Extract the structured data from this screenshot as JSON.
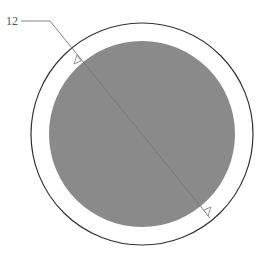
{
  "diagram": {
    "label": "12",
    "colors": {
      "outer_stroke": "#333333",
      "inner_fill": "#8a8a8a",
      "leader": "#777777"
    },
    "outer_circle": {
      "cx": 142,
      "cy": 134,
      "r": 111
    },
    "inner_circle": {
      "cx": 142,
      "cy": 134,
      "r": 93
    }
  }
}
